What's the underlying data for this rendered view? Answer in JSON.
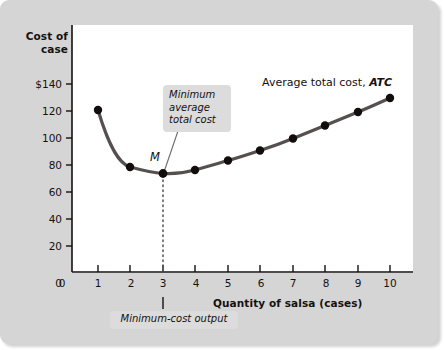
{
  "figure": {
    "y_axis_title": "Cost of\ncase",
    "x_axis_title": "Quantity of salsa (cases)",
    "series_label_text": "Average total cost, ",
    "series_label_symbol": "ATC",
    "point_label_M": "M",
    "callout_min_atc": "Minimum\naverage\ntotal cost",
    "callout_min_output": "Minimum-cost output"
  },
  "colors": {
    "panel_background": "#d5d5d5",
    "plot_background": "#ffffff",
    "curve": "#55504f",
    "marker": "#100d0c",
    "axis": "#15110f",
    "callout_background": "#dcdcdc",
    "leader_line": "#6e6a68",
    "dotted_guide": "#55504f"
  },
  "chart_data": {
    "type": "line",
    "title": "",
    "subtitle": "",
    "xlabel": "Quantity of salsa (cases)",
    "ylabel": "Cost of case",
    "xlim": [
      0,
      10.6
    ],
    "ylim": [
      0,
      150
    ],
    "grid": false,
    "legend": "inline-annotation",
    "legend_position": "top-right",
    "x_ticks": [
      0,
      1,
      2,
      3,
      4,
      5,
      6,
      7,
      8,
      9,
      10
    ],
    "x_tick_labels": [
      "0",
      "1",
      "2",
      "3",
      "4",
      "5",
      "6",
      "7",
      "8",
      "9",
      "10"
    ],
    "y_ticks": [
      0,
      20,
      40,
      60,
      80,
      100,
      120,
      140
    ],
    "y_tick_labels": [
      "0",
      "20",
      "40",
      "60",
      "80",
      "100",
      "120",
      "$140"
    ],
    "series": [
      {
        "name": "Average total cost, ATC",
        "x": [
          1,
          2,
          3,
          4,
          5,
          6,
          7,
          8,
          9,
          10
        ],
        "values": [
          120,
          78,
          72,
          74,
          81,
          90,
          100,
          110,
          120,
          130
        ],
        "markers": true
      }
    ],
    "annotations": [
      {
        "name": "minimum-average-total-cost",
        "text": "Minimum average total cost",
        "points_to_x": 3,
        "points_to_y": 72
      },
      {
        "name": "minimum-cost-output",
        "text": "Minimum-cost output",
        "points_to_x": 3,
        "points_to_y": 0
      },
      {
        "name": "point-M",
        "text": "M",
        "points_to_x": 3,
        "points_to_y": 72
      }
    ]
  }
}
